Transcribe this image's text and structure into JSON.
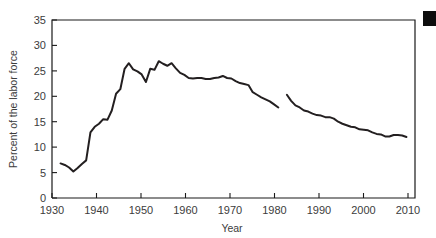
{
  "chart_data": {
    "type": "line",
    "title": "",
    "xlabel": "Year",
    "ylabel": "Percent of the labor force",
    "xlim": [
      1928,
      2013
    ],
    "ylim": [
      0,
      35
    ],
    "grid": false,
    "legend": null,
    "xticks": [
      1930,
      1940,
      1950,
      1960,
      1970,
      1980,
      1990,
      2000,
      2010
    ],
    "xtick_labels": [
      "1930",
      "1940",
      "1950",
      "1960",
      "1970",
      "1980",
      "1990",
      "2000",
      "2010"
    ],
    "yticks": [
      0,
      5,
      10,
      15,
      20,
      25,
      30,
      35
    ],
    "ytick_labels": [
      "0",
      "5",
      "10",
      "15",
      "20",
      "25",
      "30",
      "35"
    ],
    "line_color": "#231f20",
    "series": [
      {
        "name": "segment-1930-1981",
        "x": [
          1930,
          1931,
          1932,
          1933,
          1934,
          1935,
          1936,
          1937,
          1938,
          1939,
          1940,
          1941,
          1942,
          1943,
          1944,
          1945,
          1946,
          1947,
          1948,
          1949,
          1950,
          1951,
          1952,
          1953,
          1954,
          1955,
          1956,
          1957,
          1958,
          1959,
          1960,
          1961,
          1962,
          1963,
          1964,
          1965,
          1966,
          1967,
          1968,
          1969,
          1970,
          1971,
          1972,
          1973,
          1974,
          1975,
          1976,
          1977,
          1978,
          1979,
          1980,
          1981
        ],
        "y": [
          6.8,
          6.5,
          6.0,
          5.2,
          5.9,
          6.7,
          7.4,
          12.9,
          14.0,
          14.6,
          15.5,
          15.4,
          17.2,
          20.5,
          21.4,
          25.4,
          26.5,
          25.3,
          24.9,
          24.3,
          22.8,
          25.4,
          25.2,
          26.9,
          26.4,
          26.0,
          26.5,
          25.5,
          24.6,
          24.2,
          23.6,
          23.5,
          23.6,
          23.6,
          23.4,
          23.4,
          23.6,
          23.7,
          24.0,
          23.6,
          23.5,
          23.0,
          22.6,
          22.4,
          22.2,
          20.8,
          20.3,
          19.8,
          19.4,
          19.0,
          18.4,
          17.8
        ],
        "break_after": true
      },
      {
        "name": "segment-1983-2011",
        "x": [
          1983,
          1984,
          1985,
          1986,
          1987,
          1988,
          1989,
          1990,
          1991,
          1992,
          1993,
          1994,
          1995,
          1996,
          1997,
          1998,
          1999,
          2000,
          2001,
          2002,
          2003,
          2004,
          2005,
          2006,
          2007,
          2008,
          2009,
          2010,
          2011
        ],
        "y": [
          20.3,
          19.1,
          18.2,
          17.8,
          17.2,
          17.0,
          16.6,
          16.3,
          16.2,
          15.9,
          15.9,
          15.6,
          15.0,
          14.6,
          14.3,
          14.0,
          13.9,
          13.5,
          13.4,
          13.3,
          12.9,
          12.6,
          12.5,
          12.1,
          12.1,
          12.4,
          12.4,
          12.3,
          12.0
        ],
        "break_after": false
      }
    ]
  },
  "axes": {
    "x_axis_title": "Year",
    "y_axis_title": "Percent of the labor force"
  },
  "marks": {
    "corner_mark_name": "page-corner-mark"
  }
}
